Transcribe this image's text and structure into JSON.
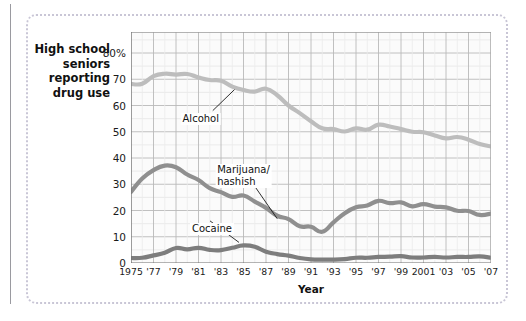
{
  "figure": {
    "y_axis_caption": "High school seniors reporting drug use",
    "x_axis_title": "Year"
  },
  "chart_data": {
    "type": "line",
    "title": "High school seniors reporting drug use",
    "xlabel": "Year",
    "ylabel": "",
    "xlim": [
      1975,
      2007
    ],
    "ylim": [
      0,
      88
    ],
    "grid": true,
    "legend": "inline-annotations",
    "ytick_labels": [
      "0",
      "10",
      "20",
      "30",
      "40",
      "50",
      "60",
      "70",
      "80%"
    ],
    "ytick_values": [
      0,
      10,
      20,
      30,
      40,
      50,
      60,
      70,
      80
    ],
    "xtick_labels": [
      "1975",
      "'77",
      "'79",
      "'81",
      "'83",
      "'85",
      "'87",
      "'89",
      "'91",
      "'93",
      "'95",
      "'97",
      "'99",
      "2001",
      "'03",
      "'05",
      "'07"
    ],
    "xtick_values": [
      1975,
      1977,
      1979,
      1981,
      1983,
      1985,
      1987,
      1989,
      1991,
      1993,
      1995,
      1997,
      1999,
      2001,
      2003,
      2005,
      2007
    ],
    "x": [
      1975,
      1976,
      1977,
      1978,
      1979,
      1980,
      1981,
      1982,
      1983,
      1984,
      1985,
      1986,
      1987,
      1988,
      1989,
      1990,
      1991,
      1992,
      1993,
      1994,
      1995,
      1996,
      1997,
      1998,
      1999,
      2000,
      2001,
      2002,
      2003,
      2004,
      2005,
      2006,
      2007
    ],
    "series": [
      {
        "name": "Alcohol",
        "color": "#bdbdbd",
        "label_x": 1981.2,
        "label_y": 55,
        "values": [
          68.2,
          68.3,
          71.2,
          72.1,
          71.8,
          72.0,
          70.7,
          69.7,
          69.4,
          67.2,
          65.9,
          65.3,
          66.4,
          63.9,
          60.0,
          57.1,
          54.0,
          51.3,
          51.0,
          50.1,
          51.3,
          50.8,
          52.7,
          52.0,
          51.0,
          50.0,
          49.8,
          48.6,
          47.5,
          48.0,
          47.0,
          45.3,
          44.4
        ]
      },
      {
        "name": "Marijuana/ hashish",
        "color": "#8f8f8f",
        "label_x": 1985.0,
        "label_y": 33,
        "values": [
          27.1,
          32.2,
          35.4,
          37.1,
          36.5,
          33.7,
          31.6,
          28.5,
          27.0,
          25.2,
          25.7,
          23.4,
          21.0,
          18.0,
          16.7,
          14.0,
          13.8,
          11.9,
          15.5,
          19.0,
          21.2,
          21.9,
          23.7,
          22.8,
          23.1,
          21.6,
          22.4,
          21.5,
          21.2,
          19.9,
          19.8,
          18.3,
          18.8
        ]
      },
      {
        "name": "Cocaine",
        "color": "#7d7d7d",
        "label_x": 1982.2,
        "label_y": 13,
        "values": [
          1.9,
          2.0,
          2.9,
          3.9,
          5.7,
          5.2,
          5.8,
          5.0,
          4.9,
          5.8,
          6.7,
          6.2,
          4.3,
          3.4,
          2.8,
          1.9,
          1.4,
          1.3,
          1.3,
          1.5,
          2.0,
          2.0,
          2.3,
          2.4,
          2.6,
          2.1,
          2.1,
          2.3,
          2.1,
          2.3,
          2.3,
          2.5,
          2.0
        ]
      }
    ]
  }
}
